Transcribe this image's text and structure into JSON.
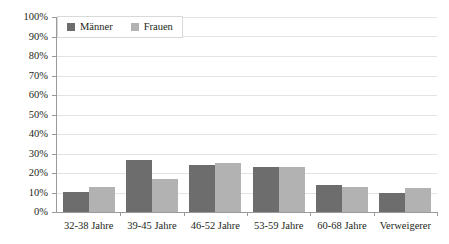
{
  "chart_data": {
    "type": "bar",
    "title": "",
    "subtitle": "",
    "xlabel": "",
    "ylabel": "",
    "categories": [
      "32-38 Jahre",
      "39-45 Jahre",
      "46-52 Jahre",
      "53-59 Jahre",
      "60-68 Jahre",
      "Verweigerer"
    ],
    "series": [
      {
        "name": "Männer",
        "color": "#6d6d6d",
        "values": [
          10.5,
          26.5,
          24,
          23,
          14,
          10
        ]
      },
      {
        "name": "Frauen",
        "color": "#b2b2b2",
        "values": [
          13,
          17,
          25,
          23,
          13,
          12.5
        ]
      }
    ],
    "ylim": [
      0,
      100
    ],
    "ytick_values": [
      0,
      10,
      20,
      30,
      40,
      50,
      60,
      70,
      80,
      90,
      100
    ],
    "ytick_labels": [
      "0%",
      "10%",
      "20%",
      "30%",
      "40%",
      "50%",
      "60%",
      "70%",
      "80%",
      "90%",
      "100%"
    ],
    "grid": true,
    "grid_axis": "y",
    "legend_position": "top-left",
    "legend_entries": [
      "Männer",
      "Frauen"
    ]
  }
}
